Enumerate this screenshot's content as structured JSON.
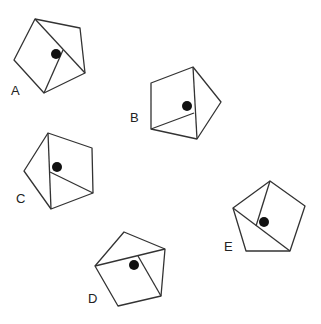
{
  "diagram": {
    "stroke_color": "#333333",
    "dot_color": "#111111",
    "shapes": [
      {
        "label": "A",
        "label_pos": [
          11,
          95
        ],
        "outline": [
          [
            35,
            19
          ],
          [
            80,
            28
          ],
          [
            85,
            73
          ],
          [
            44,
            93
          ],
          [
            14,
            60
          ]
        ],
        "lines": [
          [
            [
              35,
              19
            ],
            [
              85,
              73
            ]
          ],
          [
            [
              44,
              93
            ],
            [
              63,
              50
            ]
          ]
        ],
        "dot": [
          56,
          54
        ]
      },
      {
        "label": "B",
        "label_pos": [
          130,
          122
        ],
        "outline": [
          [
            193,
            67
          ],
          [
            221,
            102
          ],
          [
            197,
            139
          ],
          [
            151,
            129
          ],
          [
            151,
            83
          ]
        ],
        "lines": [
          [
            [
              193,
              67
            ],
            [
              197,
              139
            ]
          ],
          [
            [
              151,
              129
            ],
            [
              194,
              113
            ]
          ]
        ],
        "dot": [
          187,
          106
        ]
      },
      {
        "label": "C",
        "label_pos": [
          16,
          203
        ],
        "outline": [
          [
            48,
            133
          ],
          [
            92,
            148
          ],
          [
            93,
            193
          ],
          [
            51,
            209
          ],
          [
            24,
            171
          ]
        ],
        "lines": [
          [
            [
              48,
              133
            ],
            [
              51,
              209
            ]
          ],
          [
            [
              50,
              172
            ],
            [
              93,
              193
            ]
          ]
        ],
        "dot": [
          57,
          167
        ]
      },
      {
        "label": "D",
        "label_pos": [
          88,
          303
        ],
        "outline": [
          [
            124,
            232
          ],
          [
            165,
            249
          ],
          [
            161,
            296
          ],
          [
            118,
            306
          ],
          [
            95,
            266
          ]
        ],
        "lines": [
          [
            [
              95,
              266
            ],
            [
              165,
              249
            ]
          ],
          [
            [
              138,
              256
            ],
            [
              161,
              296
            ]
          ]
        ],
        "dot": [
          134,
          265
        ]
      },
      {
        "label": "E",
        "label_pos": [
          224,
          251
        ],
        "outline": [
          [
            270,
            181
          ],
          [
            305,
            206
          ],
          [
            290,
            251
          ],
          [
            246,
            251
          ],
          [
            233,
            208
          ]
        ],
        "lines": [
          [
            [
              233,
              208
            ],
            [
              290,
              251
            ]
          ],
          [
            [
              270,
              181
            ],
            [
              256,
              226
            ]
          ]
        ],
        "dot": [
          264,
          222
        ]
      }
    ]
  }
}
